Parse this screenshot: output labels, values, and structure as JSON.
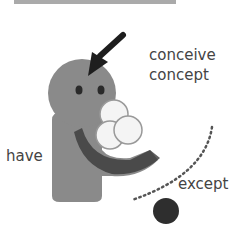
{
  "diagram": {
    "labels": {
      "conceive": "conceive",
      "concept": "concept",
      "have": "have",
      "except": "except"
    },
    "colors": {
      "top_bar": "#aaaaaa",
      "figure_body": "#8a8a8a",
      "figure_dark": "#3a3a3a",
      "ball_fill": "#f4f4f4",
      "ball_outline": "#999999",
      "arrow": "#1e1e1e",
      "dots": "#555555",
      "dark_ball": "#2e2e2e",
      "text": "#444444"
    }
  }
}
